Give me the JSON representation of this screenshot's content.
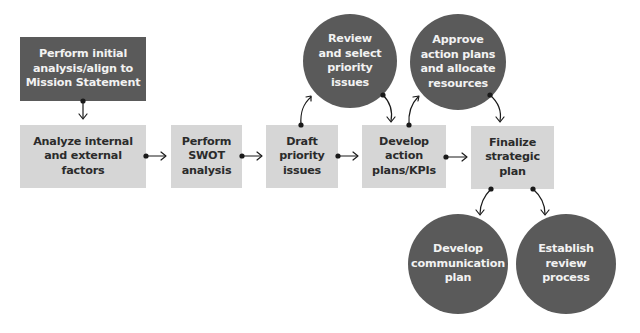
{
  "diagram": {
    "colors": {
      "dark_fill": "#5a5a5a",
      "light_fill": "#d6d6d6",
      "dark_text": "#2b2b2b",
      "light_text": "#f2f2f2",
      "connector": "#1a1a1a"
    },
    "boxes": [
      {
        "id": "initial",
        "label": "Perform initial\nanalysis/align to\nMission Statement",
        "style": "dark"
      },
      {
        "id": "analyze",
        "label": "Analyze internal\nand external\nfactors",
        "style": "light"
      },
      {
        "id": "swot",
        "label": "Perform\nSWOT\nanalysis",
        "style": "light"
      },
      {
        "id": "draft",
        "label": "Draft\npriority\nissues",
        "style": "light"
      },
      {
        "id": "develop",
        "label": "Develop\naction\nplans/KPIs",
        "style": "light"
      },
      {
        "id": "finalize",
        "label": "Finalize\nstrategic\nplan",
        "style": "light"
      }
    ],
    "circles": [
      {
        "id": "review",
        "label": "Review\nand select\npriority\nissues"
      },
      {
        "id": "approve",
        "label": "Approve\naction plans\nand allocate\nresources"
      },
      {
        "id": "communication",
        "label": "Develop\ncommunication\nplan"
      },
      {
        "id": "establish",
        "label": "Establish\nreview\nprocess"
      }
    ],
    "connections": [
      {
        "from": "initial",
        "to": "analyze"
      },
      {
        "from": "analyze",
        "to": "swot"
      },
      {
        "from": "swot",
        "to": "draft"
      },
      {
        "from": "draft",
        "to": "review"
      },
      {
        "from": "review",
        "to": "develop"
      },
      {
        "from": "draft",
        "to": "develop"
      },
      {
        "from": "develop",
        "to": "approve"
      },
      {
        "from": "approve",
        "to": "finalize"
      },
      {
        "from": "develop",
        "to": "finalize"
      },
      {
        "from": "finalize",
        "to": "communication"
      },
      {
        "from": "finalize",
        "to": "establish"
      }
    ]
  }
}
